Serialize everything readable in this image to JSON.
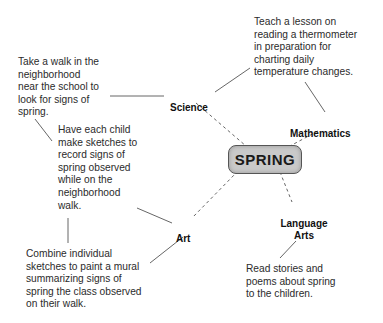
{
  "diagram": {
    "center": {
      "label": "SPRING",
      "fill": "#c9c9c9"
    },
    "subjects": [
      {
        "id": "science",
        "label": "Science"
      },
      {
        "id": "mathematics",
        "label": "Mathematics"
      },
      {
        "id": "language-arts",
        "label": "Language\nArts"
      },
      {
        "id": "art",
        "label": "Art"
      }
    ],
    "activities": [
      {
        "id": "walk",
        "subject": "Science",
        "text": "Take a walk in the\nneighborhood\nnear the school to\nlook for signs of\nspring."
      },
      {
        "id": "thermometer",
        "subject": "Mathematics",
        "text": "Teach a lesson on\nreading a thermometer\nin preparation for\ncharting daily\ntemperature changes."
      },
      {
        "id": "sketches",
        "subject": "Art",
        "text": "Have each child\nmake sketches to\nrecord signs of\nspring observed\nwhile on the\nneighborhood\nwalk."
      },
      {
        "id": "mural",
        "subject": "Art",
        "text": "Combine individual\nsketches to paint a mural\nsummarizing signs of\nspring the class observed\non their walk."
      },
      {
        "id": "stories",
        "subject": "Language Arts",
        "text": "Read stories and\npoems about spring\nto the children."
      }
    ],
    "connector_style": {
      "subject_to_center": "dashed",
      "activity_to_subject": "solid"
    }
  }
}
